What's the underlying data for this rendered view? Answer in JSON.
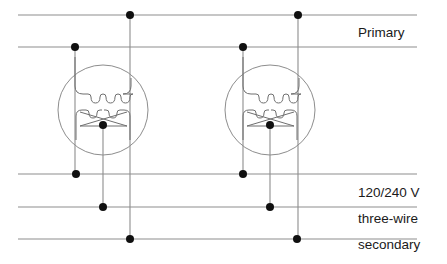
{
  "diagram": {
    "canvas": {
      "width": 447,
      "height": 264,
      "background": "#ffffff"
    },
    "colors": {
      "wire": "#8d8d8d",
      "coil": "#6f6f6f",
      "node": "#101010",
      "text": "#1a1a1a",
      "circle": "#8d8d8d"
    },
    "labels": {
      "primary": "Primary",
      "voltage": "120/240 V",
      "wire_count": "three-wire",
      "secondary": "secondary"
    },
    "label_positions": {
      "primary": {
        "x": 358,
        "y": 33
      },
      "voltage": {
        "x": 358,
        "y": 193
      },
      "wire_count": {
        "x": 358,
        "y": 219
      },
      "secondary": {
        "x": 358,
        "y": 245
      }
    },
    "bus_lines": [
      {
        "name": "primary-line-1",
        "y": 15,
        "x1": 18,
        "x2": 417
      },
      {
        "name": "primary-line-2",
        "y": 47,
        "x1": 18,
        "x2": 417
      },
      {
        "name": "secondary-line-1",
        "y": 174,
        "x1": 18,
        "x2": 417
      },
      {
        "name": "secondary-neutral",
        "y": 207,
        "x1": 18,
        "x2": 417
      },
      {
        "name": "secondary-line-2",
        "y": 239,
        "x1": 18,
        "x2": 417
      }
    ],
    "transformers": [
      {
        "name": "transformer-left",
        "center_x": 103,
        "center_y": 110,
        "radius": 45,
        "primary_tap_x": 75,
        "primary_hot_x": 130,
        "secondary_left_x": 76,
        "secondary_center_x": 103,
        "secondary_right_x": 130,
        "center_tap": {
          "x": 103,
          "y": 125
        }
      },
      {
        "name": "transformer-right",
        "center_x": 270,
        "center_y": 110,
        "radius": 45,
        "primary_tap_x": 243,
        "primary_hot_x": 298,
        "secondary_left_x": 243,
        "secondary_center_x": 270,
        "secondary_right_x": 297,
        "center_tap": {
          "x": 270,
          "y": 125
        }
      }
    ],
    "nodes": [
      {
        "name": "node-left-primary-hot",
        "x": 130,
        "y": 15
      },
      {
        "name": "node-left-primary-tap",
        "x": 75,
        "y": 47
      },
      {
        "name": "node-left-secondary-l1",
        "x": 76,
        "y": 174
      },
      {
        "name": "node-left-secondary-neutral",
        "x": 103,
        "y": 207
      },
      {
        "name": "node-left-secondary-l2",
        "x": 130,
        "y": 239
      },
      {
        "name": "node-left-center-tap",
        "x": 103,
        "y": 125
      },
      {
        "name": "node-right-primary-hot",
        "x": 298,
        "y": 15
      },
      {
        "name": "node-right-primary-tap",
        "x": 243,
        "y": 47
      },
      {
        "name": "node-right-secondary-l1",
        "x": 243,
        "y": 174
      },
      {
        "name": "node-right-secondary-neutral",
        "x": 270,
        "y": 207
      },
      {
        "name": "node-right-secondary-l2",
        "x": 297,
        "y": 239
      },
      {
        "name": "node-right-center-tap",
        "x": 270,
        "y": 125
      }
    ]
  }
}
